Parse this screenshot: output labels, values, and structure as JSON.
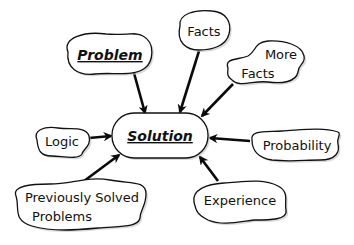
{
  "diagram": {
    "type": "concept-map",
    "center": {
      "label": "Solution",
      "style": "bold-italic-underlined"
    },
    "nodes": {
      "problem": {
        "label": "Problem",
        "style": "bold-italic-underlined"
      },
      "facts": {
        "label": "Facts"
      },
      "more_facts": {
        "line1": "More",
        "line2": "Facts"
      },
      "logic": {
        "label": "Logic"
      },
      "probability": {
        "label": "Probability"
      },
      "previously_solved": {
        "line1": "Previously Solved",
        "line2": "Problems"
      },
      "experience": {
        "label": "Experience"
      }
    },
    "edges": [
      {
        "from": "Problem",
        "to": "Solution"
      },
      {
        "from": "Facts",
        "to": "Solution"
      },
      {
        "from": "More Facts",
        "to": "Solution"
      },
      {
        "from": "Logic",
        "to": "Solution"
      },
      {
        "from": "Probability",
        "to": "Solution"
      },
      {
        "from": "Previously Solved Problems",
        "to": "Solution"
      },
      {
        "from": "Experience",
        "to": "Solution"
      }
    ],
    "colors": {
      "stroke": "#111111",
      "fill": "#ffffff",
      "shadow": "#bbbbbb"
    }
  }
}
